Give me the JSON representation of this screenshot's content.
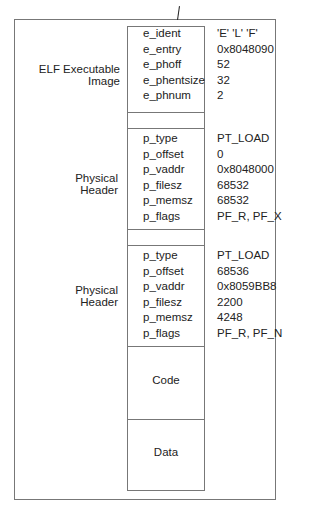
{
  "elf_header": {
    "label": "ELF Executable Image",
    "fields": [
      "e_ident",
      "e_entry",
      "e_phoff",
      "e_phentsize",
      "e_phnum"
    ],
    "values": [
      "'E'  'L'  'F'",
      "0x8048090",
      "52",
      "32",
      "2"
    ]
  },
  "program_headers": [
    {
      "label": "Physical Header",
      "fields": [
        "p_type",
        "p_offset",
        "p_vaddr",
        "p_filesz",
        "p_memsz",
        "p_flags"
      ],
      "values": [
        "PT_LOAD",
        "0",
        "0x8048000",
        "68532",
        "68532",
        "PF_R,  PF_X"
      ]
    },
    {
      "label": "Physical Header",
      "fields": [
        "p_type",
        "p_offset",
        "p_vaddr",
        "p_filesz",
        "p_memsz",
        "p_flags"
      ],
      "values": [
        "PT_LOAD",
        "68536",
        "0x8059BB8",
        "2200",
        "4248",
        "PF_R,  PF_N"
      ]
    }
  ],
  "segments": {
    "code": "Code",
    "data": "Data"
  }
}
